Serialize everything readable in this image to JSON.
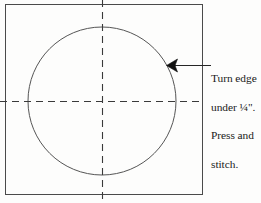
{
  "figure": {
    "type": "sewing-pattern-diagram",
    "background_color": "#fdfdfc",
    "line_color": "#3a3a3a",
    "text_color": "#1a1a1a",
    "square": {
      "name": "fabric-square",
      "x": 5,
      "y": 4,
      "width": 198,
      "height": 191,
      "stroke": "#4a4a4a"
    },
    "circle": {
      "name": "circle-applique-outline",
      "cx": 102,
      "cy": 101,
      "r": 74,
      "stroke": "#555555"
    },
    "guides": [
      {
        "name": "vertical-center-guide",
        "orientation": "vertical",
        "x": 102,
        "y1": 0,
        "y2": 203,
        "dash": "7 5"
      },
      {
        "name": "horizontal-center-guide",
        "orientation": "horizontal",
        "y": 101,
        "x1": 0,
        "x2": 203,
        "dash": "7 5"
      }
    ],
    "leader": {
      "name": "callout-leader-line",
      "x1": 211,
      "y1": 65,
      "x2": 172,
      "y2": 65,
      "arrow_at": "left",
      "points_to": "circle-edge"
    }
  },
  "callout": {
    "name": "instruction-callout",
    "lines": [
      "Turn edge",
      "under ¼\".",
      "Press and",
      "stitch."
    ],
    "full_text": "Turn edge under ¼\". Press and stitch."
  }
}
